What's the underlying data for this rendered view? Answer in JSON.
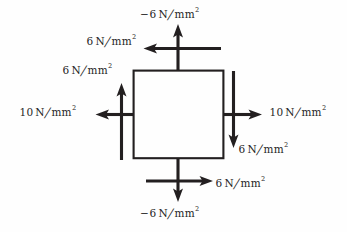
{
  "figure": {
    "type": "stress-element-diagram",
    "background_color": "#fefefe",
    "stroke_color": "#231f20",
    "text_color": "#262626",
    "element": {
      "shape": "square",
      "x": 133,
      "y": 70,
      "width": 90,
      "height": 88,
      "stroke_width": 2.2
    },
    "labels": {
      "top_normal": {
        "sign": "−",
        "value": "6",
        "unit_numerator": "N",
        "slash": "∕",
        "unit_denominator": "mm",
        "exponent": "2",
        "full_text": "−6 N∕mm²",
        "x": 140,
        "y": 8
      },
      "top_shear": {
        "sign": "",
        "value": "6",
        "unit_numerator": "N",
        "slash": "∕",
        "unit_denominator": "mm",
        "exponent": "2",
        "full_text": "6 N∕mm²",
        "x": 86,
        "y": 35
      },
      "left_shear": {
        "sign": "",
        "value": "6",
        "unit_numerator": "N",
        "slash": "∕",
        "unit_denominator": "mm",
        "exponent": "2",
        "full_text": "6 N∕mm²",
        "x": 62,
        "y": 64
      },
      "left_normal": {
        "sign": "",
        "value": "10",
        "unit_numerator": "N",
        "slash": "∕",
        "unit_denominator": "mm",
        "exponent": "2",
        "full_text": "10 N∕mm²",
        "x": 19,
        "y": 106
      },
      "right_normal": {
        "sign": "",
        "value": "10",
        "unit_numerator": "N",
        "slash": "∕",
        "unit_denominator": "mm",
        "exponent": "2",
        "full_text": "10 N∕mm²",
        "x": 269,
        "y": 106
      },
      "right_shear": {
        "sign": "",
        "value": "6",
        "unit_numerator": "N",
        "slash": "∕",
        "unit_denominator": "mm",
        "exponent": "2",
        "full_text": "6 N∕mm²",
        "x": 238,
        "y": 143
      },
      "bottom_shear": {
        "sign": "",
        "value": "6",
        "unit_numerator": "N",
        "slash": "∕",
        "unit_denominator": "mm",
        "exponent": "2",
        "full_text": "6 N∕mm²",
        "x": 215,
        "y": 177
      },
      "bottom_normal": {
        "sign": "−",
        "value": "6",
        "unit_numerator": "N",
        "slash": "∕",
        "unit_denominator": "mm",
        "exponent": "2",
        "full_text": "−6 N∕mm²",
        "x": 140,
        "y": 207
      }
    },
    "arrows": [
      {
        "name": "top-normal-arrow",
        "direction": "up",
        "from": [
          178,
          70
        ],
        "to": [
          178,
          26
        ],
        "magnitude": "-6 N/mm^2",
        "kind": "normal"
      },
      {
        "name": "top-shear-arrow",
        "direction": "left",
        "from": [
          222,
          48
        ],
        "to": [
          145,
          48
        ],
        "magnitude": "6 N/mm^2",
        "kind": "shear"
      },
      {
        "name": "left-shear-arrow",
        "direction": "up",
        "from": [
          122,
          160
        ],
        "to": [
          122,
          85
        ],
        "magnitude": "6 N/mm^2",
        "kind": "shear"
      },
      {
        "name": "left-normal-arrow",
        "direction": "left",
        "from": [
          133,
          114
        ],
        "to": [
          90,
          114
        ],
        "magnitude": "10 N/mm^2",
        "kind": "normal"
      },
      {
        "name": "right-normal-arrow",
        "direction": "right",
        "from": [
          223,
          114
        ],
        "to": [
          267,
          114
        ],
        "magnitude": "10 N/mm^2",
        "kind": "normal"
      },
      {
        "name": "right-shear-arrow",
        "direction": "down",
        "from": [
          234,
          70
        ],
        "to": [
          234,
          146
        ],
        "magnitude": "6 N/mm^2",
        "kind": "shear"
      },
      {
        "name": "bottom-shear-arrow",
        "direction": "right",
        "from": [
          146,
          181
        ],
        "to": [
          215,
          181
        ],
        "magnitude": "6 N/mm^2",
        "kind": "shear"
      },
      {
        "name": "bottom-normal-arrow",
        "direction": "down",
        "from": [
          178,
          158
        ],
        "to": [
          178,
          202
        ],
        "magnitude": "-6 N/mm^2",
        "kind": "normal"
      }
    ]
  }
}
